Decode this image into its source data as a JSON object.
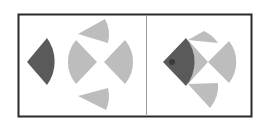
{
  "diagram": {
    "type": "visual-puzzle",
    "colors": {
      "frame": "#2a2a2a",
      "divider": "#9a9a9a",
      "dark_sector": "#5a5a5a",
      "light_sector": "#bdbdbd",
      "background": "#ffffff"
    },
    "panels": [
      {
        "name": "components",
        "description": "One dark sector and four light gray sectors arranged around a center"
      },
      {
        "name": "composite",
        "description": "Sectors assembled with dark sector overlapping light sectors"
      }
    ]
  }
}
